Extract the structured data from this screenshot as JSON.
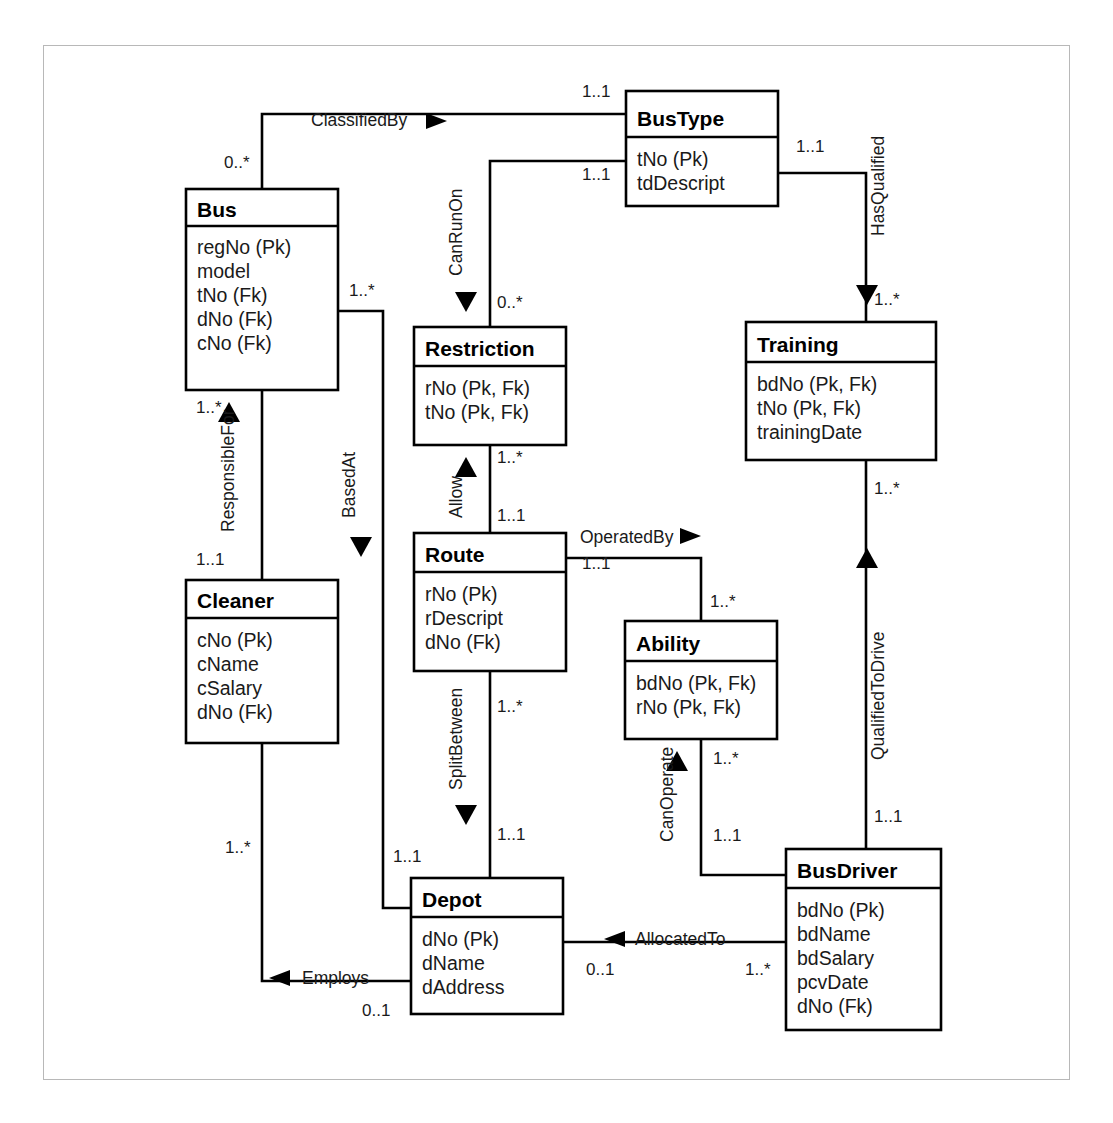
{
  "diagram": {
    "type": "uml-class-entity-relationship-diagram",
    "frame": {
      "border_color": "#b8b8b8",
      "background": "#ffffff"
    },
    "entities": [
      {
        "id": "BusType",
        "name": "BusType",
        "attributes": [
          "tNo (Pk)",
          "tdDescript"
        ],
        "x": 626,
        "y": 91,
        "w": 152,
        "h": 115
      },
      {
        "id": "Bus",
        "name": "Bus",
        "attributes": [
          "regNo (Pk)",
          "model",
          "tNo (Fk)",
          "dNo (Fk)",
          "cNo (Fk)"
        ],
        "x": 186,
        "y": 189,
        "w": 152,
        "h": 201
      },
      {
        "id": "Restriction",
        "name": "Restriction",
        "attributes": [
          "rNo (Pk, Fk)",
          "tNo (Pk, Fk)"
        ],
        "x": 414,
        "y": 327,
        "w": 152,
        "h": 118
      },
      {
        "id": "Training",
        "name": "Training",
        "attributes": [
          "bdNo (Pk, Fk)",
          "tNo (Pk, Fk)",
          "trainingDate"
        ],
        "x": 746,
        "y": 322,
        "w": 190,
        "h": 138
      },
      {
        "id": "Route",
        "name": "Route",
        "attributes": [
          "rNo (Pk)",
          "rDescript",
          "dNo (Fk)"
        ],
        "x": 414,
        "y": 533,
        "w": 152,
        "h": 138
      },
      {
        "id": "Ability",
        "name": "Ability",
        "attributes": [
          "bdNo (Pk, Fk)",
          "rNo (Pk, Fk)"
        ],
        "x": 625,
        "y": 621,
        "w": 152,
        "h": 118
      },
      {
        "id": "Cleaner",
        "name": "Cleaner",
        "attributes": [
          "cNo (Pk)",
          "cName",
          "cSalary",
          "dNo (Fk)"
        ],
        "x": 186,
        "y": 580,
        "w": 152,
        "h": 163
      },
      {
        "id": "Depot",
        "name": "Depot",
        "attributes": [
          "dNo (Pk)",
          "dName",
          "dAddress"
        ],
        "x": 411,
        "y": 878,
        "w": 152,
        "h": 136
      },
      {
        "id": "BusDriver",
        "name": "BusDriver",
        "attributes": [
          "bdNo (Pk)",
          "bdName",
          "bdSalary",
          "pcvDate",
          "dNo (Fk)"
        ],
        "x": 786,
        "y": 849,
        "w": 155,
        "h": 181
      }
    ],
    "relationships": [
      {
        "id": "ClassifiedBy",
        "label": "ClassifiedBy",
        "from": "Bus",
        "to": "BusType",
        "from_mult": "0..*",
        "to_mult": "1..1",
        "direction": "right",
        "orientation": "horizontal"
      },
      {
        "id": "CanRunOn",
        "label": "CanRunOn",
        "from": "BusType",
        "to": "Restriction",
        "from_mult": "1..1",
        "to_mult": "0..*",
        "direction": "down",
        "orientation": "vertical"
      },
      {
        "id": "HasQualified",
        "label": "HasQualified",
        "from": "BusType",
        "to": "Training",
        "from_mult": "1..1",
        "to_mult": "1..*",
        "direction": "down",
        "orientation": "vertical"
      },
      {
        "id": "Allow",
        "label": "Allow",
        "from": "Route",
        "to": "Restriction",
        "from_mult": "1..1",
        "to_mult": "1..*",
        "direction": "up",
        "orientation": "vertical"
      },
      {
        "id": "OperatedBy",
        "label": "OperatedBy",
        "from": "Route",
        "to": "Ability",
        "from_mult": "1..1",
        "to_mult": "1..*",
        "direction": "right",
        "orientation": "horizontal"
      },
      {
        "id": "ResponsibleFor",
        "label": "ResponsibleFor",
        "from": "Cleaner",
        "to": "Bus",
        "from_mult": "1..1",
        "to_mult": "1..*",
        "direction": "up",
        "orientation": "vertical"
      },
      {
        "id": "BasedAt",
        "label": "BasedAt",
        "from": "Bus",
        "to": "Depot",
        "from_mult": "1..*",
        "to_mult": "1..1",
        "direction": "down",
        "orientation": "vertical"
      },
      {
        "id": "SplitBetween",
        "label": "SplitBetween",
        "from": "Route",
        "to": "Depot",
        "from_mult": "1..*",
        "to_mult": "1..1",
        "direction": "down",
        "orientation": "vertical"
      },
      {
        "id": "CanOperate",
        "label": "CanOperate",
        "from": "BusDriver",
        "to": "Ability",
        "from_mult": "1..1",
        "to_mult": "1..*",
        "direction": "up",
        "orientation": "vertical"
      },
      {
        "id": "QualifiedToDrive",
        "label": "QualifiedToDrive",
        "from": "BusDriver",
        "to": "Training",
        "from_mult": "1..1",
        "to_mult": "1..*",
        "direction": "up",
        "orientation": "vertical"
      },
      {
        "id": "AllocatedTo",
        "label": "AllocatedTo",
        "from": "BusDriver",
        "to": "Depot",
        "from_mult": "1..*",
        "to_mult": "0..1",
        "direction": "left",
        "orientation": "horizontal"
      },
      {
        "id": "Employs",
        "label": "Employs",
        "from": "Cleaner",
        "to": "Depot",
        "from_mult": "1..*",
        "to_mult": "0..1",
        "direction": "left",
        "orientation": "horizontal"
      }
    ],
    "multiplicity_labels": [
      {
        "id": "m-classifiedby-bus",
        "text": "0..*",
        "x": 224,
        "y": 168
      },
      {
        "id": "m-classifiedby-bustype",
        "text": "1..1",
        "x": 582,
        "y": 97
      },
      {
        "id": "m-canrunon-bustype",
        "text": "1..1",
        "x": 582,
        "y": 180
      },
      {
        "id": "m-canrunon-restriction",
        "text": "0..*",
        "x": 497,
        "y": 308
      },
      {
        "id": "m-hasqualified-bustype",
        "text": "1..1",
        "x": 796,
        "y": 152
      },
      {
        "id": "m-hasqualified-training",
        "text": "1..*",
        "x": 862,
        "y": 305
      },
      {
        "id": "m-allow-restriction",
        "text": "1..*",
        "x": 497,
        "y": 463
      },
      {
        "id": "m-allow-route",
        "text": "1..1",
        "x": 497,
        "y": 521
      },
      {
        "id": "m-operatedby-route",
        "text": "1..1",
        "x": 582,
        "y": 565
      },
      {
        "id": "m-operatedby-ability",
        "text": "1..*",
        "x": 700,
        "y": 604
      },
      {
        "id": "m-responsiblefor-bus",
        "text": "1..*",
        "x": 196,
        "y": 410
      },
      {
        "id": "m-responsiblefor-cleaner",
        "text": "1..1",
        "x": 196,
        "y": 562
      },
      {
        "id": "m-basedat-bus",
        "text": "1..*",
        "x": 349,
        "y": 292
      },
      {
        "id": "m-basedat-depot",
        "text": "1..1",
        "x": 381,
        "y": 835
      },
      {
        "id": "m-splitbetween-route",
        "text": "1..*",
        "x": 497,
        "y": 709
      },
      {
        "id": "m-splitbetween-depot",
        "text": "1..1",
        "x": 497,
        "y": 837
      },
      {
        "id": "m-canoperate-ability",
        "text": "1..*",
        "x": 713,
        "y": 758
      },
      {
        "id": "m-canoperate-busdriver",
        "text": "1..1",
        "x": 713,
        "y": 838
      },
      {
        "id": "m-qualifiedtodrive-training",
        "text": "1..*",
        "x": 862,
        "y": 490
      },
      {
        "id": "m-qualifiedtodrive-busdriver",
        "text": "1..1",
        "x": 862,
        "y": 818
      },
      {
        "id": "m-allocatedto-depot",
        "text": "0..1",
        "x": 586,
        "y": 972
      },
      {
        "id": "m-allocatedto-busdriver",
        "text": "1..*",
        "x": 745,
        "y": 972
      },
      {
        "id": "m-employs-cleaner",
        "text": "1..*",
        "x": 225,
        "y": 850
      },
      {
        "id": "m-employs-depot",
        "text": "0..1",
        "x": 362,
        "y": 1013
      }
    ]
  }
}
